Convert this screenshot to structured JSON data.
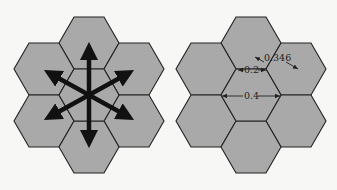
{
  "figure": {
    "left_panel": {
      "description": "Seven-hexagon cluster with six bidirectional arrows radiating from the center cell",
      "cells": 7,
      "arrows": 6
    },
    "right_panel": {
      "description": "Seven-hexagon cluster with dimension annotations",
      "cells": 7,
      "labels": {
        "side_to_side": "0.2",
        "vertex_to_vertex": "0.4",
        "center_to_center": "0.346"
      }
    },
    "colors": {
      "cell_fill": "#a9a9a9",
      "cell_stroke": "#222222",
      "arrow": "#111111",
      "background": "#f7f7f5"
    }
  }
}
